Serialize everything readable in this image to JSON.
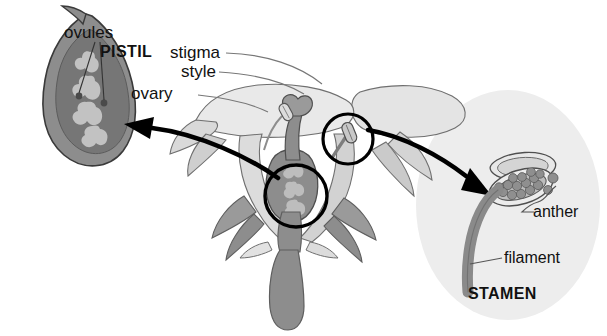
{
  "diagram": {
    "background_color": "#ffffff",
    "labels": {
      "ovules": "ovules",
      "pistil": "PISTIL",
      "stigma": "stigma",
      "style": "style",
      "ovary": "ovary",
      "anther": "anther",
      "filament": "filament",
      "stamen": "STAMEN"
    },
    "colors": {
      "outline": "#3a3a3a",
      "arrow": "#000000",
      "leader": "#555555",
      "petal_light": "#eaeaea",
      "petal_mid": "#d6d6d6",
      "tissue_gray": "#8d8d8d",
      "tissue_dark": "#7a7a7a",
      "ovary_fill": "#9a9a9a",
      "ovule_fill": "#b9b9b9",
      "stamen_halo": "#ededed",
      "pollen": "#9a9a9a",
      "text": "#111111"
    },
    "callout_circles": [
      {
        "name": "ovary-magnifier",
        "cx": 296,
        "cy": 196,
        "r": 31
      },
      {
        "name": "anther-magnifier",
        "cx": 348,
        "cy": 139,
        "r": 25
      }
    ],
    "arrows": [
      {
        "name": "ovary-detail-arrow",
        "from": "ovary-magnifier",
        "to": "ovule-cutaway",
        "direction": "left"
      },
      {
        "name": "anther-detail-arrow",
        "from": "anther-magnifier",
        "to": "stamen-detail",
        "direction": "right"
      }
    ]
  }
}
